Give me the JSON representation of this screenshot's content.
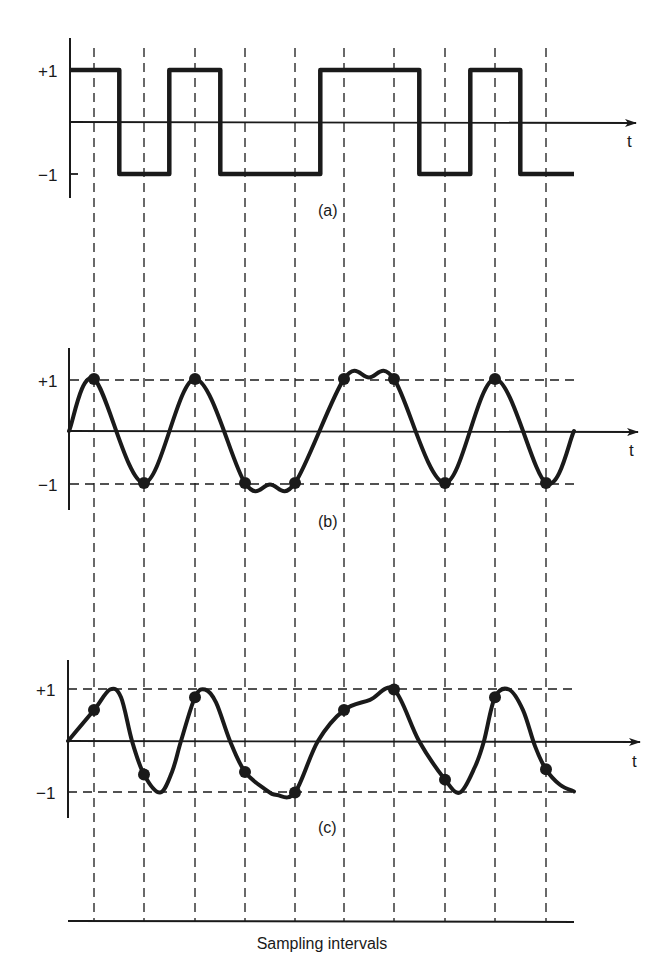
{
  "figure": {
    "sampling_label": "Sampling intervals",
    "time_axis_label": "t",
    "y_ticks": {
      "pos": "+1",
      "neg": "−1"
    },
    "sampling_x": [
      94,
      144,
      195,
      245,
      295,
      344,
      394,
      445,
      495,
      546
    ],
    "colors": {
      "ink": "#1a1a1a",
      "background": "#ffffff"
    }
  },
  "panels": [
    {
      "id": "a",
      "label": "(a)",
      "description": "Binary square-wave data sequence",
      "bits": [
        1,
        0,
        1,
        0,
        0,
        1,
        1,
        0,
        1,
        0
      ],
      "y_plus": 70,
      "y_zero": 122,
      "y_minus": 174,
      "axis_top": 38,
      "axis_bottom": 198,
      "label_pos": [
        330,
        216
      ],
      "has_level_guides": false
    },
    {
      "id": "b",
      "label": "(b)",
      "description": "Band-limited waveform passing through +1/-1 at sampling instants",
      "samples": [
        1,
        -1,
        1,
        -1,
        -1,
        1,
        1,
        -1,
        1,
        -1
      ],
      "y_plus": 380,
      "y_zero": 431,
      "y_minus": 484,
      "axis_top": 348,
      "axis_bottom": 510,
      "label_pos": [
        330,
        527
      ],
      "has_level_guides": true
    },
    {
      "id": "c",
      "label": "(c)",
      "description": "Distorted waveform with intersymbol interference; samples deviate from +1/-1",
      "samples": [
        0.6,
        -0.65,
        0.85,
        -0.6,
        -1.0,
        0.6,
        1.0,
        -0.75,
        0.85,
        -0.55
      ],
      "y_plus": 689,
      "y_zero": 741,
      "y_minus": 792,
      "axis_top": 660,
      "axis_bottom": 818,
      "label_pos": [
        330,
        833
      ],
      "has_level_guides": true
    }
  ]
}
